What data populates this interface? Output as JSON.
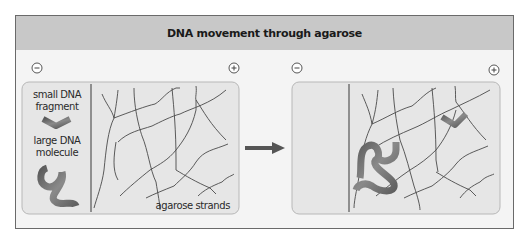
{
  "header": {
    "title": "DNA movement through agarose"
  },
  "left_panel": {
    "negative_electrode": "−",
    "positive_electrode": "+",
    "labels": {
      "small_fragment": [
        "small DNA",
        "fragment"
      ],
      "large_molecule": [
        "large DNA",
        "molecule"
      ],
      "strands": "agarose strands"
    }
  },
  "arrow": {
    "direction": "right"
  },
  "right_panel": {
    "negative_electrode": "−",
    "positive_electrode": "+"
  },
  "colors": {
    "header_bg": "#c8c8c8",
    "frame_bg": "#f4f4f4",
    "panel_bg": "#e6e6e6",
    "panel_border": "#b5b5b5",
    "strand": "#4a4a4a",
    "dna": "#6e6e6e",
    "arrow": "#555555"
  }
}
